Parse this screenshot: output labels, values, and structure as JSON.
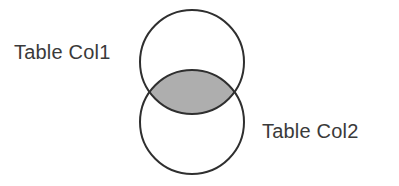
{
  "diagram": {
    "type": "venn-2-set",
    "title": "",
    "background_color": "#ffffff",
    "stroke_color": "#2f2f2f",
    "stroke_width": 2,
    "intersection_fill": "#aeaeae",
    "set_fill": "#ffffff",
    "sets": [
      {
        "id": "set-top",
        "label": "Table Col1",
        "label_position": "left",
        "center_x": 192,
        "center_y": 62,
        "radius": 52,
        "fill": "#ffffff"
      },
      {
        "id": "set-bottom",
        "label": "Table Col2",
        "label_position": "right",
        "center_x": 192,
        "center_y": 122,
        "radius": 52,
        "fill": "#ffffff"
      }
    ],
    "intersection": {
      "id": "intersection-lens",
      "label": "",
      "shaded": true,
      "fill": "#aeaeae",
      "left_x": 148,
      "right_x": 236,
      "top_y": 65,
      "bottom_y": 119
    },
    "labels": {
      "left": "Table Col1",
      "right": "Table Col2"
    }
  }
}
